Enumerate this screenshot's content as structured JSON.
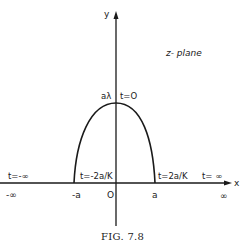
{
  "figure": {
    "caption": "FIG. 7.8",
    "plane_label": "z- plane",
    "axes": {
      "x_label": "x",
      "y_label": "y"
    },
    "curve": {
      "top_label": "aλ",
      "top_param": "t=O",
      "left_foot_param": "t=-2a/K",
      "right_foot_param": "t=2a/K"
    },
    "x_axis_params": {
      "left_end": "t=-∞",
      "right_end": "t= ∞"
    },
    "x_axis_ticks": {
      "neg_infinity": "-∞",
      "neg_a": "-a",
      "origin": "O",
      "pos_a": "a",
      "pos_infinity": "∞"
    }
  }
}
